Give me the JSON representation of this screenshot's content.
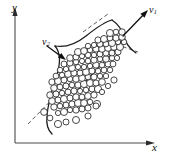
{
  "figure": {
    "kind": "scientific-diagram",
    "background_color": "#ffffff",
    "ink_color": "#1b1b1b"
  },
  "axes": {
    "x": {
      "label": "x",
      "label_subscript": "",
      "line": {
        "x1": 15,
        "y1": 143,
        "x2": 148,
        "y2": 143
      },
      "arrow_tip": {
        "x": 155,
        "y": 143
      },
      "color": "#4a4a4a"
    },
    "y": {
      "label": "y",
      "label_subscript": "",
      "line": {
        "x1": 15,
        "y1": 143,
        "x2": 15,
        "y2": 14
      },
      "arrow_tip": {
        "x": 15,
        "y": 7
      },
      "color": "#4a4a4a"
    }
  },
  "vectors": [
    {
      "name": "v1",
      "label": "v",
      "label_subscript": "1",
      "tail": {
        "x": 123,
        "y": 36
      },
      "tip": {
        "x": 148,
        "y": 10
      },
      "direction": "up-right",
      "color": "#111111"
    },
    {
      "name": "v2",
      "label": "v",
      "label_subscript": "2",
      "tail": {
        "x": 47,
        "y": 46
      },
      "tip": {
        "x": 66,
        "y": 60
      },
      "direction": "down-right",
      "color": "#111111"
    }
  ],
  "dashed_lines": [
    {
      "name": "major-axis-dashed",
      "x1": 28,
      "y1": 124,
      "x2": 120,
      "y2": 30
    },
    {
      "name": "cross-dash-upper-left",
      "x1": 83,
      "y1": 32,
      "x2": 108,
      "y2": 14
    },
    {
      "name": "cross-dash-lower-right",
      "x1": 104,
      "y1": 40,
      "x2": 138,
      "y2": 52
    }
  ],
  "outline": {
    "name": "cluster-boundary",
    "stroke_color": "#1b1b1b",
    "stroke_width": 1.25,
    "note": "S-shaped envelope enclosing the particle cloud, open at upper-right"
  },
  "particles": {
    "count": 118,
    "marker": "open-circle",
    "fill": "#ffffff",
    "stroke": "#272727",
    "radius_min": 2.6,
    "radius_max": 3.6,
    "positions": [
      [
        58,
        113
      ],
      [
        64,
        112
      ],
      [
        70,
        110
      ],
      [
        76,
        110
      ],
      [
        82,
        109
      ],
      [
        88,
        108
      ],
      [
        54,
        107
      ],
      [
        60,
        106
      ],
      [
        66,
        105
      ],
      [
        72,
        104
      ],
      [
        78,
        103
      ],
      [
        84,
        103
      ],
      [
        90,
        102
      ],
      [
        97,
        104
      ],
      [
        52,
        101
      ],
      [
        58,
        100
      ],
      [
        64,
        99
      ],
      [
        70,
        98
      ],
      [
        76,
        97
      ],
      [
        82,
        97
      ],
      [
        88,
        96
      ],
      [
        94,
        95
      ],
      [
        50,
        95
      ],
      [
        56,
        94
      ],
      [
        62,
        93
      ],
      [
        68,
        92
      ],
      [
        74,
        91
      ],
      [
        80,
        91
      ],
      [
        86,
        90
      ],
      [
        92,
        89
      ],
      [
        98,
        89
      ],
      [
        54,
        88
      ],
      [
        60,
        87
      ],
      [
        66,
        86
      ],
      [
        72,
        85
      ],
      [
        78,
        85
      ],
      [
        84,
        84
      ],
      [
        90,
        83
      ],
      [
        96,
        83
      ],
      [
        102,
        82
      ],
      [
        52,
        82
      ],
      [
        58,
        81
      ],
      [
        64,
        80
      ],
      [
        70,
        79
      ],
      [
        76,
        79
      ],
      [
        82,
        78
      ],
      [
        88,
        77
      ],
      [
        94,
        77
      ],
      [
        100,
        76
      ],
      [
        106,
        76
      ],
      [
        56,
        76
      ],
      [
        62,
        75
      ],
      [
        68,
        74
      ],
      [
        74,
        73
      ],
      [
        80,
        73
      ],
      [
        86,
        72
      ],
      [
        92,
        71
      ],
      [
        98,
        71
      ],
      [
        104,
        70
      ],
      [
        110,
        70
      ],
      [
        60,
        70
      ],
      [
        66,
        69
      ],
      [
        72,
        68
      ],
      [
        78,
        67
      ],
      [
        84,
        67
      ],
      [
        90,
        66
      ],
      [
        96,
        65
      ],
      [
        102,
        65
      ],
      [
        108,
        64
      ],
      [
        113,
        64
      ],
      [
        64,
        64
      ],
      [
        70,
        63
      ],
      [
        76,
        62
      ],
      [
        82,
        61
      ],
      [
        88,
        61
      ],
      [
        94,
        60
      ],
      [
        100,
        59
      ],
      [
        106,
        59
      ],
      [
        112,
        58
      ],
      [
        117,
        58
      ],
      [
        70,
        58
      ],
      [
        76,
        57
      ],
      [
        82,
        56
      ],
      [
        88,
        55
      ],
      [
        94,
        55
      ],
      [
        100,
        54
      ],
      [
        106,
        53
      ],
      [
        112,
        53
      ],
      [
        118,
        52
      ],
      [
        78,
        52
      ],
      [
        84,
        51
      ],
      [
        90,
        50
      ],
      [
        96,
        49
      ],
      [
        102,
        49
      ],
      [
        108,
        48
      ],
      [
        114,
        47
      ],
      [
        120,
        47
      ],
      [
        88,
        46
      ],
      [
        94,
        45
      ],
      [
        100,
        44
      ],
      [
        106,
        44
      ],
      [
        112,
        43
      ],
      [
        118,
        42
      ],
      [
        124,
        42
      ],
      [
        98,
        40
      ],
      [
        104,
        39
      ],
      [
        110,
        38
      ],
      [
        116,
        38
      ],
      [
        122,
        37
      ],
      [
        110,
        33
      ],
      [
        116,
        32
      ],
      [
        122,
        32
      ],
      [
        102,
        92
      ],
      [
        108,
        86
      ],
      [
        114,
        80
      ],
      [
        96,
        106
      ],
      [
        88,
        116
      ],
      [
        76,
        120
      ],
      [
        66,
        122
      ],
      [
        58,
        124
      ],
      [
        50,
        118
      ],
      [
        44,
        112
      ]
    ]
  }
}
